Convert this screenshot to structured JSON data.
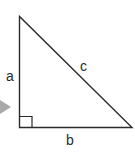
{
  "diagram": {
    "type": "right-triangle",
    "labels": {
      "side_a": "a",
      "side_b": "b",
      "hypotenuse_c": "c"
    },
    "colors": {
      "stroke": "#2b2b2b",
      "arrow": "#a9a9a9",
      "background": "#ffffff"
    }
  }
}
